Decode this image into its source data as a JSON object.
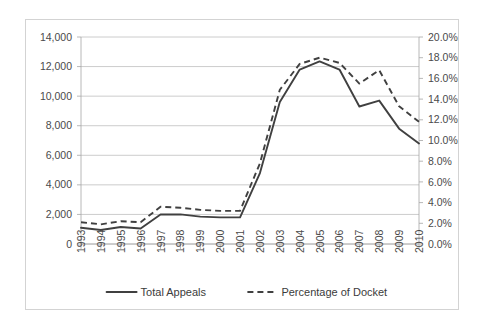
{
  "chart_data": {
    "type": "line",
    "title": "",
    "subtitle": "",
    "xlabel": "",
    "ylabel": "",
    "grid": true,
    "legend_position": "bottom",
    "categories": [
      "1993",
      "1994",
      "1995",
      "1996",
      "1997",
      "1998",
      "1999",
      "2000",
      "2001",
      "2002",
      "2003",
      "2004",
      "2005",
      "2006",
      "2007",
      "2008",
      "2009",
      "2010"
    ],
    "axes": {
      "left": {
        "label": "",
        "ylim": [
          0,
          14000
        ],
        "ticks": [
          0,
          2000,
          4000,
          6000,
          8000,
          10000,
          12000,
          14000
        ],
        "tick_labels": [
          "0",
          "2,000",
          "4,000",
          "6,000",
          "8,000",
          "10,000",
          "12,000",
          "14,000"
        ]
      },
      "right": {
        "label": "",
        "ylim": [
          0,
          20
        ],
        "ticks": [
          0,
          2,
          4,
          6,
          8,
          10,
          12,
          14,
          16,
          18,
          20
        ],
        "tick_labels": [
          "0.0%",
          "2.0%",
          "4.0%",
          "6.0%",
          "8.0%",
          "10.0%",
          "12.0%",
          "14.0%",
          "16.0%",
          "18.0%",
          "20.0%"
        ]
      }
    },
    "series": [
      {
        "name": "Total Appeals",
        "axis": "left",
        "style": "solid",
        "color": "#404040",
        "values": [
          1100,
          950,
          1150,
          1050,
          2000,
          2000,
          1850,
          1800,
          1800,
          4800,
          9600,
          11800,
          12350,
          11800,
          9300,
          9700,
          7800,
          6800
        ]
      },
      {
        "name": "Percentage of Docket",
        "axis": "right",
        "style": "dashed",
        "color": "#404040",
        "values": [
          2.1,
          1.9,
          2.2,
          2.1,
          3.6,
          3.5,
          3.3,
          3.2,
          3.2,
          7.8,
          14.9,
          17.4,
          18.0,
          17.5,
          15.5,
          16.8,
          13.3,
          11.8
        ]
      }
    ],
    "legend": [
      {
        "label": "Total Appeals",
        "style": "solid"
      },
      {
        "label": "Percentage of Docket",
        "style": "dashed"
      }
    ]
  }
}
